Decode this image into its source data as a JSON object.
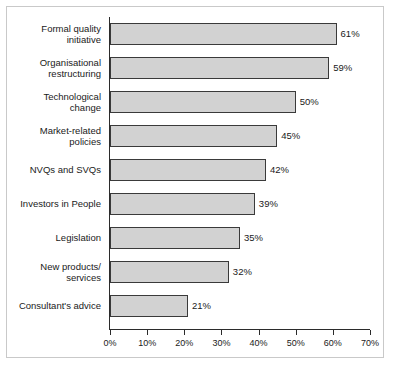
{
  "chart_data": {
    "type": "bar",
    "orientation": "horizontal",
    "title": "",
    "xlabel": "",
    "ylabel": "",
    "xlim": [
      0,
      70
    ],
    "grid": false,
    "legend": null,
    "tick_labels": [
      "0%",
      "10%",
      "20%",
      "30%",
      "40%",
      "50%",
      "60%",
      "70%"
    ],
    "ticks": [
      0,
      10,
      20,
      30,
      40,
      50,
      60,
      70
    ],
    "categories": [
      "Formal quality\ninitiative",
      "Organisational\nrestructuring",
      "Technological\nchange",
      "Market-related\npolicies",
      "NVQs and SVQs",
      "Investors in People",
      "Legislation",
      "New products/\nservices",
      "Consultant's advice"
    ],
    "values": [
      61,
      59,
      50,
      45,
      42,
      39,
      35,
      32,
      21
    ],
    "value_labels": [
      "61%",
      "59%",
      "50%",
      "45%",
      "42%",
      "39%",
      "35%",
      "32%",
      "21%"
    ],
    "colors": {
      "bar_fill": "#d2d2d2",
      "bar_border": "#3a3a3a",
      "axis": "#2b2b2b",
      "text": "#1a1a1a",
      "frame": "#c9c9c9",
      "background": "#ffffff"
    }
  }
}
